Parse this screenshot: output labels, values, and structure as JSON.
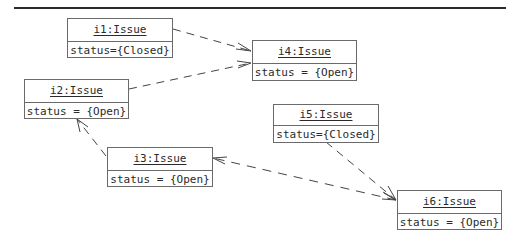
{
  "diagram": {
    "type": "UML object diagram",
    "objects": [
      {
        "id": "i1",
        "name": "i1:Issue",
        "attribute": "status={Closed}"
      },
      {
        "id": "i2",
        "name": "i2:Issue",
        "attribute": "status = {Open}"
      },
      {
        "id": "i3",
        "name": "i3:Issue",
        "attribute": "status = {Open}"
      },
      {
        "id": "i4",
        "name": "i4:Issue",
        "attribute": "status = {Open}"
      },
      {
        "id": "i5",
        "name": "i5:Issue",
        "attribute": "status={Closed}"
      },
      {
        "id": "i6",
        "name": "i6:Issue",
        "attribute": "status = {Open}"
      }
    ],
    "links": [
      {
        "from": "i1",
        "to": "i4",
        "style": "dashed-arrow"
      },
      {
        "from": "i2",
        "to": "i4",
        "style": "dashed-arrow"
      },
      {
        "from": "i3",
        "to": "i2",
        "style": "dashed-arrow"
      },
      {
        "from": "i6",
        "to": "i3",
        "style": "dashed-arrow"
      },
      {
        "from": "i5",
        "to": "i6",
        "style": "dashed-arrow"
      }
    ]
  }
}
